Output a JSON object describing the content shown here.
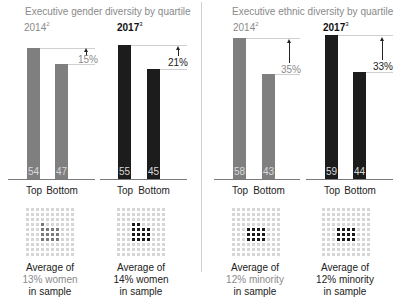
{
  "panels": [
    {
      "title": "Executive gender diversity by quartile",
      "groups": [
        {
          "year": "2014",
          "footnote": "2",
          "style": "gray",
          "bars": [
            {
              "label": "Top",
              "value": 54
            },
            {
              "label": "Bottom",
              "value": 47
            }
          ],
          "difference": "15%",
          "caption": {
            "line1": "Average of",
            "line2": "13% women",
            "line3": "in sample"
          }
        },
        {
          "year": "2017",
          "footnote": "3",
          "style": "dark",
          "bars": [
            {
              "label": "Top",
              "value": 55
            },
            {
              "label": "Bottom",
              "value": 45
            }
          ],
          "difference": "21%",
          "caption": {
            "line1": "Average of",
            "line2": "14% women",
            "line3": "in sample"
          }
        }
      ]
    },
    {
      "title": "Executive ethnic diversity by quartile",
      "groups": [
        {
          "year": "2014",
          "footnote": "2",
          "style": "gray",
          "bars": [
            {
              "label": "Top",
              "value": 58
            },
            {
              "label": "Bottom",
              "value": 43
            }
          ],
          "difference": "35%",
          "caption": {
            "line1": "Average of",
            "line2": "12% minority",
            "line3": "in sample"
          }
        },
        {
          "year": "2017",
          "footnote": "3",
          "style": "dark",
          "bars": [
            {
              "label": "Top",
              "value": 59
            },
            {
              "label": "Bottom",
              "value": 44
            }
          ],
          "difference": "33%",
          "caption": {
            "line1": "Average of",
            "line2": "12% minority",
            "line3": "in sample"
          }
        }
      ]
    }
  ],
  "colors": {
    "gray_bar": "#7f7f7f",
    "dark_bar": "#1c1c1c",
    "muted_text": "#8a8a8a"
  },
  "chart_data": [
    {
      "type": "bar",
      "title": "Executive gender diversity by quartile",
      "categories": [
        "Top",
        "Bottom"
      ],
      "series": [
        {
          "name": "2014",
          "values": [
            54,
            47
          ],
          "difference_label": "15%",
          "sample_note": "Average of 13% women in sample"
        },
        {
          "name": "2017",
          "values": [
            55,
            45
          ],
          "difference_label": "21%",
          "sample_note": "Average of 14% women in sample"
        }
      ],
      "xlabel": "",
      "ylabel": "",
      "grid": false
    },
    {
      "type": "bar",
      "title": "Executive ethnic diversity by quartile",
      "categories": [
        "Top",
        "Bottom"
      ],
      "series": [
        {
          "name": "2014",
          "values": [
            58,
            43
          ],
          "difference_label": "35%",
          "sample_note": "Average of 12% minority in sample"
        },
        {
          "name": "2017",
          "values": [
            59,
            44
          ],
          "difference_label": "33%",
          "sample_note": "Average of 12% minority in sample"
        }
      ],
      "xlabel": "",
      "ylabel": "",
      "grid": false
    }
  ]
}
